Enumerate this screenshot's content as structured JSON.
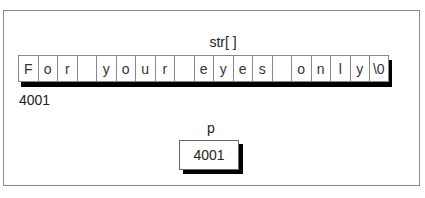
{
  "diagram": {
    "array": {
      "label": "str[ ]",
      "cells": [
        "F",
        "o",
        "r",
        "",
        "y",
        "o",
        "u",
        "r",
        "",
        "e",
        "y",
        "e",
        "s",
        "",
        "o",
        "n",
        "l",
        "y",
        "\\0"
      ],
      "base_address": "4001"
    },
    "pointer": {
      "label": "p",
      "value": "4001"
    }
  }
}
